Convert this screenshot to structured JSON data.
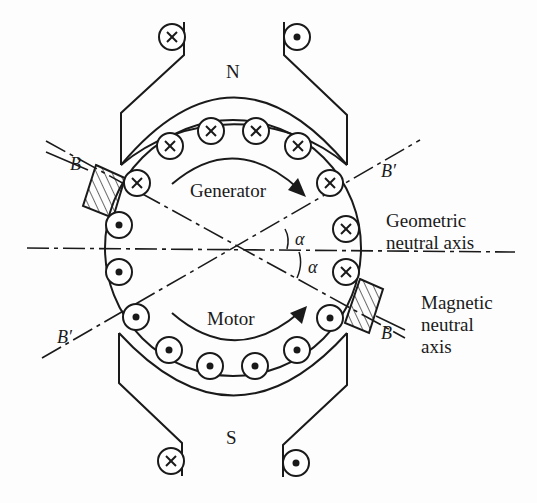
{
  "diagram": {
    "poles": {
      "north": "N",
      "south": "S"
    },
    "rotation_labels": {
      "generator": "Generator",
      "motor": "Motor"
    },
    "axis_labels": {
      "geometric": [
        "Geometric",
        "neutral axis"
      ],
      "magnetic": [
        "Magnetic",
        "neutral",
        "axis"
      ]
    },
    "brush_labels": {
      "left_top": "B",
      "right_bottom": "B",
      "prime_upper_right": "B′",
      "prime_lower_left": "B′"
    },
    "angle_label": "α",
    "angle_labels": [
      "α",
      "α"
    ],
    "field_coils": [
      {
        "pos": "top-left",
        "symbol": "cross"
      },
      {
        "pos": "top-right",
        "symbol": "dot"
      },
      {
        "pos": "bottom-left",
        "symbol": "cross"
      },
      {
        "pos": "bottom-right",
        "symbol": "dot"
      }
    ],
    "armature_conductors": {
      "upper_half": "cross",
      "lower_half": "dot",
      "count_cross": 8,
      "count_dot": 8
    },
    "colors": {
      "ink": "#1a1a1a",
      "paper": "#fdfdfd"
    }
  }
}
